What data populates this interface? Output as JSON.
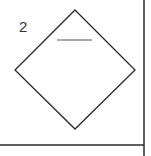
{
  "diagram": {
    "label": "2",
    "shape": "diamond",
    "colors": {
      "stroke": "#2a2a2a",
      "inner_line": "#555555",
      "background": "#ffffff"
    },
    "diamond": {
      "top": [
        75,
        10
      ],
      "right": [
        135,
        70
      ],
      "bottom": [
        75,
        129
      ],
      "left": [
        15,
        70
      ]
    },
    "inner_line": {
      "x1": 57,
      "y1": 40,
      "x2": 92,
      "y2": 40
    },
    "border_right": {
      "x": 144,
      "y1": 0,
      "y2": 156
    },
    "border_bottom": {
      "y": 145,
      "x1": 0,
      "x2": 144
    }
  }
}
